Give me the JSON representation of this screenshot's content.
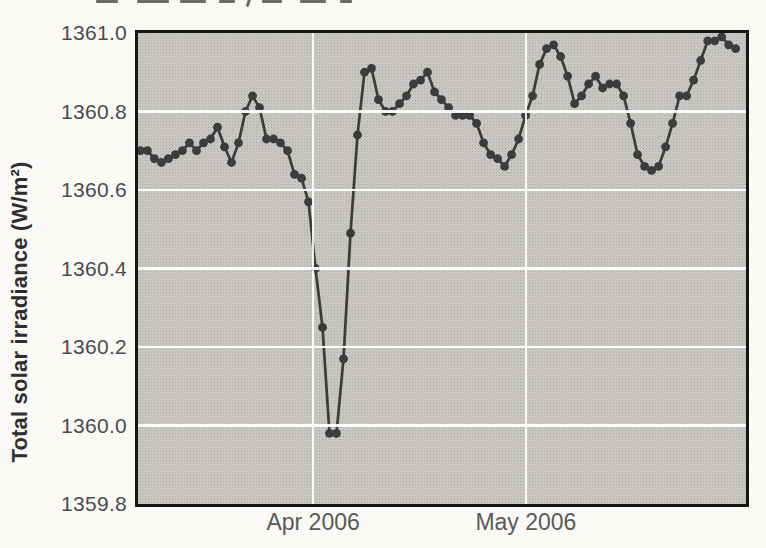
{
  "chart_data": {
    "type": "line",
    "title": "",
    "ylabel": "Total solar irradiance (W/m²)",
    "xlabel": "",
    "values_unit": "W/m²",
    "ylim": [
      1359.8,
      1361.0
    ],
    "yticks": [
      1361.0,
      1360.8,
      1360.6,
      1360.4,
      1360.2,
      1360.0,
      1359.8
    ],
    "ytick_labels": [
      "1361.0",
      "1360.8",
      "1360.6",
      "1360.4",
      "1360.2",
      "1360.0",
      "1359.8"
    ],
    "xticks": [
      {
        "label": "Apr 2006",
        "frac": 0.288
      },
      {
        "label": "May 2006",
        "frac": 0.638
      }
    ],
    "grid": true,
    "legend": "none",
    "cadence": "daily points, early March through late May 2006",
    "x_frac_start": 0.004,
    "x_frac_end": 0.983,
    "series": [
      {
        "name": "Total solar irradiance",
        "marker": "circle",
        "values": [
          1360.7,
          1360.7,
          1360.68,
          1360.67,
          1360.68,
          1360.69,
          1360.7,
          1360.72,
          1360.7,
          1360.72,
          1360.73,
          1360.76,
          1360.71,
          1360.67,
          1360.72,
          1360.8,
          1360.84,
          1360.81,
          1360.73,
          1360.73,
          1360.72,
          1360.7,
          1360.64,
          1360.63,
          1360.57,
          1360.4,
          1360.25,
          1359.98,
          1359.98,
          1360.17,
          1360.49,
          1360.74,
          1360.9,
          1360.91,
          1360.83,
          1360.8,
          1360.8,
          1360.82,
          1360.84,
          1360.87,
          1360.88,
          1360.9,
          1360.85,
          1360.83,
          1360.81,
          1360.79,
          1360.79,
          1360.79,
          1360.77,
          1360.72,
          1360.69,
          1360.68,
          1360.66,
          1360.69,
          1360.73,
          1360.79,
          1360.84,
          1360.92,
          1360.96,
          1360.97,
          1360.94,
          1360.89,
          1360.82,
          1360.84,
          1360.87,
          1360.89,
          1360.86,
          1360.87,
          1360.87,
          1360.84,
          1360.77,
          1360.69,
          1360.66,
          1360.65,
          1360.66,
          1360.71,
          1360.77,
          1360.84,
          1360.84,
          1360.88,
          1360.93,
          1360.98,
          1360.98,
          1360.99,
          1360.97,
          1360.96
        ]
      }
    ],
    "colors": {
      "line": "#3c3c3c",
      "marker": "#3c3c3c",
      "plot_bg": "#cccac7",
      "grid": "#ffffff",
      "border": "#161616",
      "tick_text": "#4b4b4b",
      "axis_title_text": "#2e2e2e"
    }
  }
}
